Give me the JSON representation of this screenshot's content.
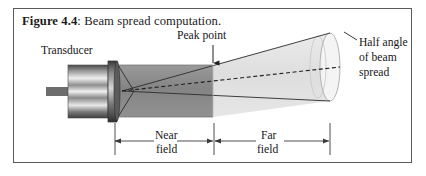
{
  "figure": {
    "caption_label": "Figure 4.4",
    "caption_separator": ":",
    "caption_text": " Beam spread computation."
  },
  "labels": {
    "transducer": "Transducer",
    "peak_point": "Peak point",
    "half_angle_line1": "Half angle",
    "half_angle_line2": "of beam",
    "half_angle_line3": "spread",
    "near_field_line1": "Near",
    "near_field_line2": "field",
    "far_field_line1": "Far",
    "far_field_line2": "field"
  },
  "colors": {
    "frame": "#5a5a5a",
    "near_field_fill": "#8a8a8a",
    "far_field_fill": "#e2e2e2",
    "cone_cap_fill": "#f2f2f2",
    "outline": "#2b2b2b",
    "text": "#16161a",
    "transducer_dark": "#3d3d3d",
    "transducer_light": "#d8d8d8",
    "dimension_line": "#3a3a3a"
  },
  "geometry": {
    "transducer_face_x": 102,
    "beam_origin_x": 104,
    "axis_y": 82,
    "peak_point_x": 200,
    "cone_end_x": 316,
    "near_field_start_x": 101,
    "near_field_end_x": 199,
    "far_field_start_x": 201,
    "far_field_end_x": 315,
    "dimension_y": 132
  }
}
